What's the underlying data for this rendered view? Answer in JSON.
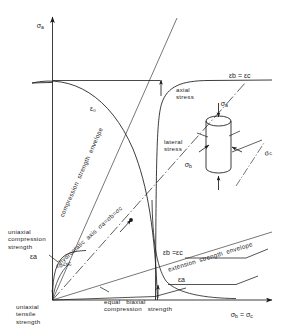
{
  "figure": {
    "background_color": "#ffffff",
    "line_color": "#1a1a1a",
    "text_color": "#1a1a1a"
  },
  "axes": {
    "vertical_label": "σa",
    "vertical_label_plain": "σ",
    "vertical_sub": "a",
    "horizontal_sub_left": "b",
    "horizontal_sub_right": "c",
    "horizontal_eq": " = σ"
  },
  "labels": {
    "compression_envelope": "compression  strength  envelope",
    "extension_envelope": "extension  strength  envelope",
    "hydrostatic_axis": "hydrostatic  axis  σa=σb=σc",
    "uniaxial_compression": "uniaxial\ncompression\nstrength",
    "uniaxial_tensile": "uniaxial\ntensile\nstrength",
    "equal_biaxial": "equal   biaxial\ncompression   strength",
    "axial_stress": "axial\nstress",
    "lateral_stress": "lateral\nstress"
  },
  "strain_labels": {
    "eps_zero_curve": "ε₀",
    "eps_a_left": "εa",
    "eps_bc_left": "εb=εc",
    "eps_bc_right": "εb = εc",
    "eps_a_right": "εa",
    "eps_bc_mid": "εb =εc"
  },
  "specimen": {
    "axial_symbol": "σa",
    "lateral_symbol": "σb",
    "depth_symbol": "σc"
  }
}
